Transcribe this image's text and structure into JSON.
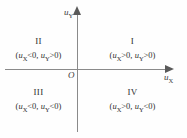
{
  "diagram": {
    "axes": {
      "x_label_base": "u",
      "x_label_sub": "X",
      "y_label_base": "u",
      "y_label_sub": "Y",
      "origin_label": "O"
    },
    "quadrants": [
      {
        "id": "quadrant-1",
        "numeral": "I",
        "condition_prefix": "(",
        "var1_base": "u",
        "var1_sub": "X",
        "var1_rel": ">0,",
        "var2_base": "u",
        "var2_sub": "Y",
        "var2_rel": ">0)"
      },
      {
        "id": "quadrant-2",
        "numeral": "II",
        "condition_prefix": "(",
        "var1_base": "u",
        "var1_sub": "X",
        "var1_rel": "<0,",
        "var2_base": "u",
        "var2_sub": "Y",
        "var2_rel": ">0)"
      },
      {
        "id": "quadrant-3",
        "numeral": "III",
        "condition_prefix": "(",
        "var1_base": "u",
        "var1_sub": "X",
        "var1_rel": "<0,",
        "var2_base": "u",
        "var2_sub": "Y",
        "var2_rel": "<0)"
      },
      {
        "id": "quadrant-4",
        "numeral": "IV",
        "condition_prefix": "(",
        "var1_base": "u",
        "var1_sub": "X",
        "var1_rel": ">0,",
        "var2_base": "u",
        "var2_sub": "Y",
        "var2_rel": "<0)"
      }
    ],
    "colors": {
      "background": "#fefefe",
      "axis": "#8a8a8a",
      "arrow": "#5a5a5a",
      "text": "#2e2e2e"
    }
  }
}
